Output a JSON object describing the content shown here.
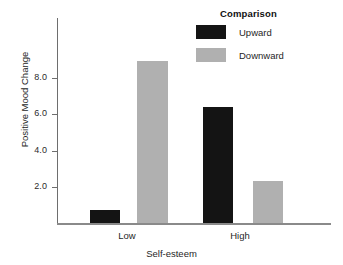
{
  "chart_data": {
    "type": "bar",
    "title": "",
    "xlabel": "Self-esteem",
    "ylabel": "Positive Mood Change",
    "categories": [
      "Low",
      "High"
    ],
    "series": [
      {
        "name": "Upward",
        "values": [
          0.6,
          5.2
        ],
        "color": "#141414"
      },
      {
        "name": "Downward",
        "values": [
          7.25,
          1.9
        ],
        "color": "#b0b0b0"
      }
    ],
    "ylim": [
      0,
      9.2
    ],
    "yticks": [
      2.0,
      4.0,
      6.0,
      8.0
    ],
    "ytick_labels": [
      "2.0",
      "4.0",
      "6.0",
      "8.0"
    ],
    "grid": false,
    "legend": {
      "title": "Comparison",
      "position": "top-right",
      "entries": [
        {
          "label": "Upward",
          "color": "#141414"
        },
        {
          "label": "Downward",
          "color": "#b0b0b0"
        }
      ]
    }
  }
}
